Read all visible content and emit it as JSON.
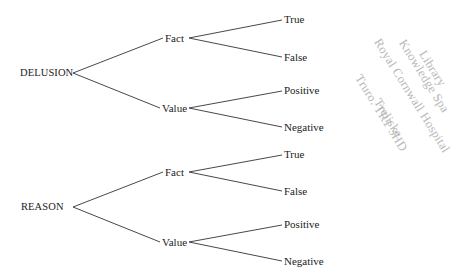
{
  "diagram": {
    "type": "tree",
    "trees": [
      {
        "root": "DELUSION",
        "branches": [
          {
            "label": "Fact",
            "leaves": [
              "True",
              "False"
            ]
          },
          {
            "label": "Value",
            "leaves": [
              "Positive",
              "Negative"
            ]
          }
        ]
      },
      {
        "root": "REASON",
        "branches": [
          {
            "label": "Fact",
            "leaves": [
              "True",
              "False"
            ]
          },
          {
            "label": "Value",
            "leaves": [
              "Positive",
              "Negative"
            ]
          }
        ]
      }
    ]
  },
  "stamp": {
    "lines": [
      "Library",
      "Knowledge Spa",
      "Royal Cornwall Hospital",
      "Treliske",
      "Truro. TR1 3HD"
    ],
    "color": "#b8b8b8"
  }
}
